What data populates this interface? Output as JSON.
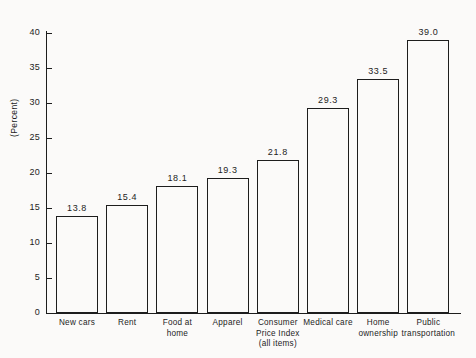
{
  "chart_data": {
    "type": "bar",
    "title": "",
    "subtitle": "",
    "xlabel": "",
    "ylabel": "(Percent)",
    "ylim": [
      0,
      40
    ],
    "ytick_step": 5,
    "ytick_labels": [
      "0",
      "5",
      "10",
      "15",
      "20",
      "25",
      "30",
      "35",
      "40"
    ],
    "ytick_values": [
      0,
      5,
      10,
      15,
      20,
      25,
      30,
      35,
      40
    ],
    "grid": false,
    "legend": null,
    "bar_style": "unfilled-outline",
    "colors": {
      "line": "#1d1d1d",
      "bar_fill": "#fbfaf9",
      "background": "#fbfaf9",
      "text": "#1d1d1d"
    },
    "categories": [
      "New cars",
      "Rent",
      "Food at home",
      "Apparel",
      "Consumer Price Index (all items)",
      "Medical care",
      "Home ownership",
      "Public transportation"
    ],
    "category_label_lines": [
      [
        "New cars"
      ],
      [
        "Rent"
      ],
      [
        "Food at",
        "home"
      ],
      [
        "Apparel"
      ],
      [
        "Consumer",
        "Price Index",
        "(all items)"
      ],
      [
        "Medical care"
      ],
      [
        "Home",
        "ownership"
      ],
      [
        "Public",
        "transportation"
      ]
    ],
    "values": [
      13.8,
      15.4,
      18.1,
      19.3,
      21.8,
      29.3,
      33.5,
      39.0
    ],
    "value_labels": [
      "13.8",
      "15.4",
      "18.1",
      "19.3",
      "21.8",
      "29.3",
      "33.5",
      "39.0"
    ]
  }
}
